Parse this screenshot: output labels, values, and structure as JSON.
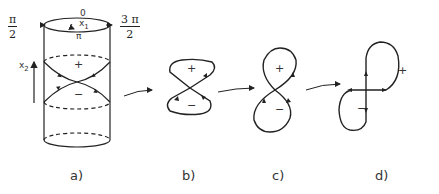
{
  "figure": {
    "panels": [
      {
        "id": "a",
        "label": "a)",
        "description": "Cylinder with crossing trajectories"
      },
      {
        "id": "b",
        "label": "b)",
        "description": "Bowtie loop"
      },
      {
        "id": "c",
        "label": "c)",
        "description": "Figure-eight loop"
      },
      {
        "id": "d",
        "label": "d)",
        "description": "Twisted figure-eight loop"
      }
    ],
    "cylinder_labels": {
      "left_num": "π",
      "left_den": "2",
      "right_num": "3 π",
      "right_den": "2",
      "top": "0",
      "bottom": "π",
      "x1": "x",
      "x1_sub": "1",
      "x2": "x",
      "x2_sub": "2"
    },
    "signs": {
      "plus": "+",
      "minus": "−"
    }
  }
}
